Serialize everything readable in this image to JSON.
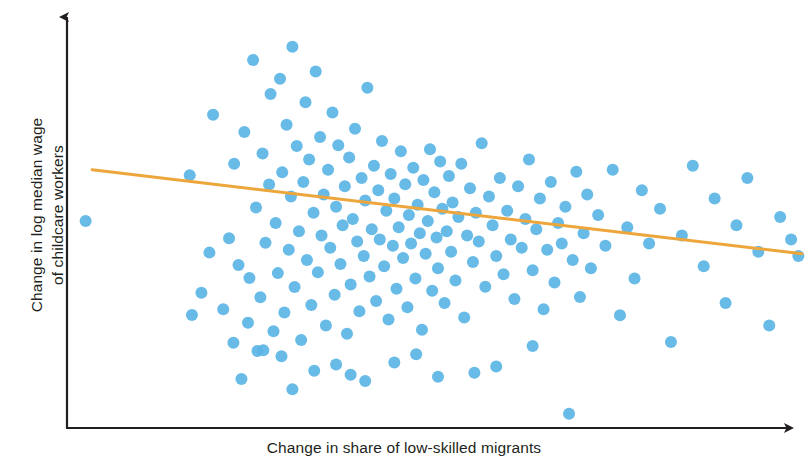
{
  "figure": {
    "title": "",
    "background_color": "#ffffff"
  },
  "axes": {
    "x_label": "Change in share of low-skilled migrants",
    "y_label_line1": "Change in log median wage",
    "y_label_line2": "of childcare workers",
    "axis_color": "#231f20",
    "x_axis_has_arrow": true,
    "y_axis_has_arrow": true,
    "tick_labels_shown": false
  },
  "style": {
    "point_color": "#5bb4e5",
    "point_radius_px": 6,
    "trend_line_color": "#eda63c",
    "trend_line_width_px": 3
  },
  "chart_data": {
    "type": "scatter",
    "title": "",
    "xlabel": "Change in share of low-skilled migrants",
    "ylabel": "Change in log median wage of childcare workers",
    "grid": false,
    "legend": "none",
    "axis_tick_labels": [],
    "xlim": [
      0,
      100
    ],
    "ylim": [
      0,
      100
    ],
    "point_color": "#5bb4e5",
    "trend_line": {
      "name": "fitted regression line",
      "color": "#eda63c",
      "x_start": 2.5,
      "y_start": 62.0,
      "x_end": 100.0,
      "y_end": 41.5,
      "slope_sign": "negative"
    },
    "n_points": 182,
    "points": [
      [
        1.6,
        49.5
      ],
      [
        15.9,
        60.7
      ],
      [
        16.2,
        26.6
      ],
      [
        17.5,
        32.0
      ],
      [
        18.6,
        41.8
      ],
      [
        19.1,
        75.4
      ],
      [
        20.5,
        28.0
      ],
      [
        21.3,
        45.3
      ],
      [
        21.9,
        19.8
      ],
      [
        22.0,
        63.5
      ],
      [
        22.6,
        38.8
      ],
      [
        23.4,
        71.2
      ],
      [
        23.9,
        24.7
      ],
      [
        24.1,
        35.6
      ],
      [
        24.6,
        88.8
      ],
      [
        25.0,
        52.8
      ],
      [
        25.2,
        17.8
      ],
      [
        25.6,
        30.9
      ],
      [
        25.9,
        66.0
      ],
      [
        26.3,
        44.2
      ],
      [
        26.8,
        58.4
      ],
      [
        27.0,
        80.5
      ],
      [
        27.4,
        22.6
      ],
      [
        27.7,
        49.0
      ],
      [
        28.0,
        36.8
      ],
      [
        28.3,
        84.2
      ],
      [
        28.6,
        61.4
      ],
      [
        28.9,
        27.2
      ],
      [
        29.2,
        73.0
      ],
      [
        29.5,
        42.5
      ],
      [
        29.8,
        55.5
      ],
      [
        30.0,
        92.0
      ],
      [
        30.3,
        33.4
      ],
      [
        30.6,
        67.8
      ],
      [
        30.9,
        47.0
      ],
      [
        31.2,
        20.5
      ],
      [
        31.5,
        59.0
      ],
      [
        31.8,
        78.5
      ],
      [
        32.0,
        40.0
      ],
      [
        32.3,
        64.5
      ],
      [
        32.6,
        29.0
      ],
      [
        32.9,
        51.5
      ],
      [
        33.2,
        86.0
      ],
      [
        33.5,
        37.0
      ],
      [
        33.8,
        70.0
      ],
      [
        34.0,
        46.0
      ],
      [
        34.3,
        56.0
      ],
      [
        34.6,
        24.0
      ],
      [
        34.9,
        62.0
      ],
      [
        35.2,
        43.0
      ],
      [
        35.5,
        76.0
      ],
      [
        35.8,
        31.5
      ],
      [
        36.0,
        53.0
      ],
      [
        36.3,
        68.0
      ],
      [
        36.6,
        39.0
      ],
      [
        36.9,
        48.5
      ],
      [
        37.2,
        58.0
      ],
      [
        37.5,
        22.0
      ],
      [
        37.8,
        65.0
      ],
      [
        38.0,
        34.0
      ],
      [
        38.3,
        50.0
      ],
      [
        38.6,
        72.0
      ],
      [
        38.9,
        44.5
      ],
      [
        39.2,
        27.5
      ],
      [
        39.5,
        60.0
      ],
      [
        39.8,
        41.0
      ],
      [
        40.0,
        54.5
      ],
      [
        40.3,
        82.0
      ],
      [
        40.6,
        36.0
      ],
      [
        40.9,
        47.5
      ],
      [
        41.2,
        63.0
      ],
      [
        41.5,
        30.0
      ],
      [
        41.8,
        57.0
      ],
      [
        42.0,
        45.0
      ],
      [
        42.3,
        69.0
      ],
      [
        42.6,
        38.5
      ],
      [
        42.9,
        52.0
      ],
      [
        43.2,
        25.5
      ],
      [
        43.5,
        61.0
      ],
      [
        43.8,
        43.5
      ],
      [
        44.0,
        55.0
      ],
      [
        44.3,
        33.0
      ],
      [
        44.6,
        48.0
      ],
      [
        44.9,
        66.5
      ],
      [
        45.2,
        40.5
      ],
      [
        45.5,
        58.5
      ],
      [
        45.8,
        28.5
      ],
      [
        46.0,
        51.0
      ],
      [
        46.3,
        44.0
      ],
      [
        46.6,
        62.5
      ],
      [
        46.9,
        35.5
      ],
      [
        47.2,
        53.5
      ],
      [
        47.5,
        46.5
      ],
      [
        47.8,
        23.0
      ],
      [
        48.0,
        59.5
      ],
      [
        48.3,
        41.5
      ],
      [
        48.6,
        49.5
      ],
      [
        48.9,
        67.0
      ],
      [
        49.2,
        32.5
      ],
      [
        49.5,
        56.5
      ],
      [
        49.8,
        45.5
      ],
      [
        50.0,
        38.0
      ],
      [
        50.3,
        64.0
      ],
      [
        50.6,
        52.5
      ],
      [
        50.9,
        29.5
      ],
      [
        51.2,
        47.0
      ],
      [
        51.5,
        60.5
      ],
      [
        51.8,
        42.0
      ],
      [
        52.0,
        54.0
      ],
      [
        52.4,
        35.0
      ],
      [
        52.8,
        50.5
      ],
      [
        53.2,
        63.5
      ],
      [
        53.6,
        26.0
      ],
      [
        54.0,
        46.0
      ],
      [
        54.4,
        57.5
      ],
      [
        54.8,
        39.5
      ],
      [
        55.2,
        51.5
      ],
      [
        55.6,
        44.5
      ],
      [
        56.0,
        68.5
      ],
      [
        56.5,
        33.5
      ],
      [
        57.0,
        55.5
      ],
      [
        57.5,
        48.5
      ],
      [
        58.0,
        41.0
      ],
      [
        58.5,
        60.0
      ],
      [
        59.0,
        36.5
      ],
      [
        59.5,
        52.0
      ],
      [
        60.0,
        45.0
      ],
      [
        60.5,
        30.5
      ],
      [
        61.0,
        58.0
      ],
      [
        61.5,
        43.0
      ],
      [
        62.0,
        50.0
      ],
      [
        62.5,
        64.5
      ],
      [
        63.0,
        37.5
      ],
      [
        63.5,
        47.5
      ],
      [
        64.0,
        55.0
      ],
      [
        64.5,
        28.0
      ],
      [
        65.0,
        42.5
      ],
      [
        65.5,
        59.0
      ],
      [
        66.0,
        34.5
      ],
      [
        66.5,
        49.0
      ],
      [
        67.0,
        44.0
      ],
      [
        67.5,
        53.0
      ],
      [
        68.0,
        2.5
      ],
      [
        68.5,
        40.0
      ],
      [
        69.0,
        61.5
      ],
      [
        69.5,
        31.0
      ],
      [
        70.0,
        46.5
      ],
      [
        70.5,
        56.0
      ],
      [
        71.0,
        38.0
      ],
      [
        72.0,
        51.0
      ],
      [
        73.0,
        43.5
      ],
      [
        74.0,
        62.0
      ],
      [
        75.0,
        26.5
      ],
      [
        76.0,
        48.0
      ],
      [
        77.0,
        35.5
      ],
      [
        78.0,
        57.0
      ],
      [
        79.0,
        44.0
      ],
      [
        80.5,
        52.5
      ],
      [
        82.0,
        20.0
      ],
      [
        83.5,
        46.0
      ],
      [
        85.0,
        63.0
      ],
      [
        86.5,
        38.5
      ],
      [
        88.0,
        55.0
      ],
      [
        89.5,
        29.5
      ],
      [
        91.0,
        48.5
      ],
      [
        92.5,
        60.0
      ],
      [
        94.0,
        42.0
      ],
      [
        95.5,
        24.0
      ],
      [
        97.0,
        50.5
      ],
      [
        98.5,
        45.0
      ],
      [
        99.5,
        41.0
      ],
      [
        36.0,
        14.5
      ],
      [
        38.0,
        12.0
      ],
      [
        28.5,
        16.5
      ],
      [
        33.0,
        13.0
      ],
      [
        44.0,
        15.0
      ],
      [
        55.0,
        12.5
      ],
      [
        58.0,
        14.0
      ],
      [
        23.0,
        11.0
      ],
      [
        26.0,
        18.0
      ],
      [
        40.0,
        10.5
      ],
      [
        47.0,
        17.0
      ],
      [
        50.0,
        11.5
      ],
      [
        63.0,
        19.0
      ],
      [
        30.0,
        8.5
      ]
    ]
  }
}
